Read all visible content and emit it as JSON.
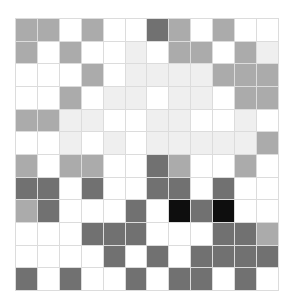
{
  "board": {
    "rows": 12,
    "cols": 12,
    "palette": {
      "0": "#ffffff",
      "1": "#efefef",
      "2": "#ababab",
      "3": "#717171",
      "4": "#0e0e0e"
    },
    "cells": [
      [
        2,
        2,
        0,
        2,
        0,
        0,
        3,
        2,
        0,
        2,
        0,
        0
      ],
      [
        2,
        0,
        2,
        0,
        0,
        1,
        0,
        2,
        2,
        0,
        2,
        1
      ],
      [
        0,
        0,
        0,
        2,
        0,
        1,
        1,
        1,
        1,
        2,
        2,
        2
      ],
      [
        0,
        0,
        2,
        0,
        1,
        1,
        0,
        1,
        1,
        0,
        2,
        2
      ],
      [
        2,
        2,
        1,
        1,
        0,
        0,
        1,
        1,
        0,
        0,
        1,
        0
      ],
      [
        0,
        0,
        1,
        0,
        1,
        0,
        1,
        1,
        1,
        1,
        1,
        2
      ],
      [
        2,
        0,
        2,
        2,
        0,
        0,
        3,
        2,
        0,
        0,
        2,
        0
      ],
      [
        3,
        3,
        0,
        3,
        0,
        0,
        3,
        3,
        0,
        3,
        0,
        0
      ],
      [
        2,
        3,
        0,
        0,
        0,
        3,
        0,
        4,
        3,
        4,
        0,
        0
      ],
      [
        0,
        0,
        0,
        3,
        3,
        3,
        0,
        0,
        0,
        3,
        3,
        2
      ],
      [
        0,
        0,
        0,
        0,
        3,
        0,
        3,
        0,
        3,
        3,
        3,
        3
      ],
      [
        3,
        0,
        3,
        0,
        0,
        3,
        0,
        3,
        3,
        0,
        3,
        0
      ]
    ]
  }
}
